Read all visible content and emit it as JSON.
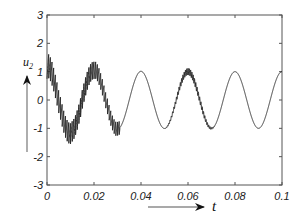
{
  "chart_data": {
    "type": "line",
    "title": "",
    "xlabel": "t",
    "ylabel": "u2",
    "ylabel_main": "u",
    "ylabel_sub": "2",
    "xlim": [
      0,
      0.1
    ],
    "ylim": [
      -3,
      3
    ],
    "xticks": [
      0,
      0.02,
      0.04,
      0.06,
      0.08,
      0.1
    ],
    "xtick_labels": [
      "0",
      "0.02",
      "0.04",
      "0.06",
      "0.08",
      "0.1"
    ],
    "yticks": [
      -3,
      -2,
      -1,
      0,
      1,
      2,
      3
    ],
    "ytick_labels": [
      "-3",
      "-2",
      "-1",
      "0",
      "1",
      "2",
      "3"
    ],
    "grid": false,
    "legend": null,
    "series": [
      {
        "name": "u2",
        "color": "#222222",
        "description": "50 Hz sinusoid (period 0.02 s, amplitude ~1) with decaying high-frequency ripple; initial transient starting near 2",
        "fundamental_freq_hz": 50,
        "fundamental_amplitude": 1.0,
        "ripple_freq_hz": 1400,
        "ripple_segments": [
          {
            "t_start": 0.0,
            "t_end": 0.031,
            "amplitude": 0.45
          },
          {
            "t_start": 0.05,
            "t_end": 0.072,
            "amplitude": 0.12
          }
        ],
        "key_points": [
          {
            "t": 0.0,
            "u": 2.0
          },
          {
            "t": 0.01,
            "u": -1.5
          },
          {
            "t": 0.02,
            "u": 1.3
          },
          {
            "t": 0.03,
            "u": -1.1
          },
          {
            "t": 0.04,
            "u": 1.0
          },
          {
            "t": 0.05,
            "u": -1.0
          },
          {
            "t": 0.06,
            "u": 1.2
          },
          {
            "t": 0.07,
            "u": -1.1
          },
          {
            "t": 0.08,
            "u": 1.0
          },
          {
            "t": 0.09,
            "u": -1.0
          },
          {
            "t": 0.1,
            "u": 1.0
          }
        ]
      }
    ]
  }
}
